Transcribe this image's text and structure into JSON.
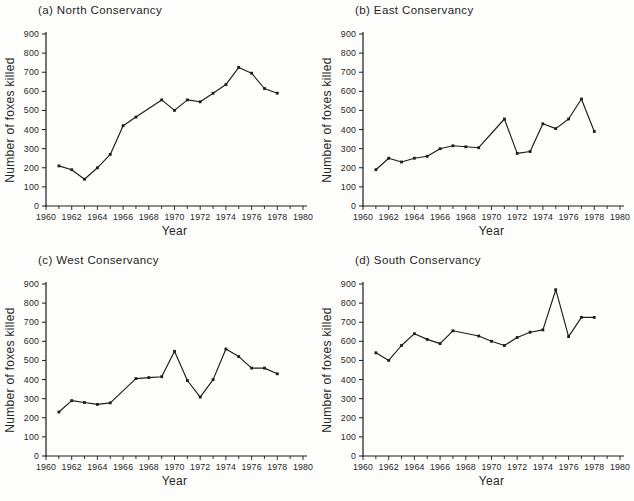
{
  "figure": {
    "background": "#fdfdfc",
    "ink": "#1c1c1c",
    "xlabel": "Year",
    "ylabel": "Number of foxes killed"
  },
  "chart_data": [
    {
      "type": "line",
      "title": "(a) North Conservancy",
      "region": "North",
      "xlabel": "Year",
      "ylabel": "Number of foxes killed",
      "xlim": [
        1960,
        1980
      ],
      "ylim": [
        0,
        900
      ],
      "x_labeled_ticks": [
        1960,
        1962,
        1964,
        1966,
        1968,
        1970,
        1972,
        1974,
        1976,
        1978,
        1980
      ],
      "y_ticks": [
        0,
        100,
        200,
        300,
        400,
        500,
        600,
        700,
        800,
        900
      ],
      "grid": "off",
      "legend": "none",
      "points": [
        [
          1961,
          210
        ],
        [
          1962,
          190
        ],
        [
          1963,
          140
        ],
        [
          1964,
          200
        ],
        [
          1965,
          270
        ],
        [
          1966,
          420
        ],
        [
          1967,
          465
        ],
        [
          1969,
          555
        ],
        [
          1970,
          500
        ],
        [
          1971,
          555
        ],
        [
          1972,
          545
        ],
        [
          1973,
          590
        ],
        [
          1974,
          635
        ],
        [
          1975,
          725
        ],
        [
          1976,
          695
        ],
        [
          1977,
          615
        ],
        [
          1978,
          590
        ]
      ]
    },
    {
      "type": "line",
      "title": "(b) East Conservancy",
      "region": "East",
      "xlabel": "Year",
      "ylabel": "Number of foxes killed",
      "xlim": [
        1960,
        1980
      ],
      "ylim": [
        0,
        900
      ],
      "x_labeled_ticks": [
        1960,
        1962,
        1964,
        1966,
        1968,
        1970,
        1972,
        1974,
        1976,
        1978,
        1980
      ],
      "y_ticks": [
        0,
        100,
        200,
        300,
        400,
        500,
        600,
        700,
        800,
        900
      ],
      "grid": "off",
      "legend": "none",
      "points": [
        [
          1961,
          190
        ],
        [
          1962,
          250
        ],
        [
          1963,
          230
        ],
        [
          1964,
          250
        ],
        [
          1965,
          260
        ],
        [
          1966,
          300
        ],
        [
          1967,
          315
        ],
        [
          1968,
          310
        ],
        [
          1969,
          305
        ],
        [
          1971,
          455
        ],
        [
          1972,
          275
        ],
        [
          1973,
          285
        ],
        [
          1974,
          430
        ],
        [
          1975,
          405
        ],
        [
          1976,
          455
        ],
        [
          1977,
          560
        ],
        [
          1978,
          390
        ]
      ]
    },
    {
      "type": "line",
      "title": "(c) West Conservancy",
      "region": "West",
      "xlabel": "Year",
      "ylabel": "Number of foxes killed",
      "xlim": [
        1960,
        1980
      ],
      "ylim": [
        0,
        900
      ],
      "x_labeled_ticks": [
        1960,
        1962,
        1964,
        1966,
        1968,
        1970,
        1972,
        1974,
        1976,
        1978,
        1980
      ],
      "y_ticks": [
        0,
        100,
        200,
        300,
        400,
        500,
        600,
        700,
        800,
        900
      ],
      "grid": "off",
      "legend": "none",
      "points": [
        [
          1961,
          230
        ],
        [
          1962,
          290
        ],
        [
          1963,
          280
        ],
        [
          1964,
          270
        ],
        [
          1965,
          278
        ],
        [
          1967,
          405
        ],
        [
          1968,
          410
        ],
        [
          1969,
          415
        ],
        [
          1970,
          548
        ],
        [
          1971,
          395
        ],
        [
          1972,
          308
        ],
        [
          1973,
          400
        ],
        [
          1974,
          560
        ],
        [
          1975,
          520
        ],
        [
          1976,
          460
        ],
        [
          1977,
          460
        ],
        [
          1978,
          430
        ]
      ]
    },
    {
      "type": "line",
      "title": "(d) South Conservancy",
      "region": "South",
      "xlabel": "Year",
      "ylabel": "Number of foxes killed",
      "xlim": [
        1960,
        1980
      ],
      "ylim": [
        0,
        900
      ],
      "x_labeled_ticks": [
        1960,
        1962,
        1964,
        1966,
        1968,
        1970,
        1972,
        1974,
        1976,
        1978,
        1980
      ],
      "y_ticks": [
        0,
        100,
        200,
        300,
        400,
        500,
        600,
        700,
        800,
        900
      ],
      "grid": "off",
      "legend": "none",
      "points": [
        [
          1961,
          540
        ],
        [
          1962,
          500
        ],
        [
          1963,
          578
        ],
        [
          1964,
          640
        ],
        [
          1965,
          610
        ],
        [
          1966,
          588
        ],
        [
          1967,
          655
        ],
        [
          1969,
          628
        ],
        [
          1970,
          600
        ],
        [
          1971,
          578
        ],
        [
          1972,
          620
        ],
        [
          1973,
          648
        ],
        [
          1974,
          660
        ],
        [
          1975,
          870
        ],
        [
          1976,
          625
        ],
        [
          1977,
          725
        ],
        [
          1978,
          725
        ]
      ]
    }
  ]
}
